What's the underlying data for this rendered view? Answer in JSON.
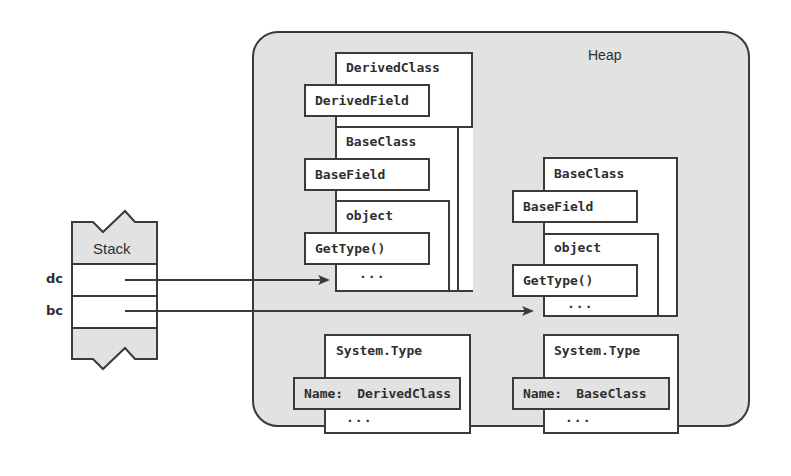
{
  "heap": {
    "label": "Heap"
  },
  "stack": {
    "label": "Stack",
    "slots": [
      {
        "name": "dc",
        "points_to": "derived_object"
      },
      {
        "name": "bc",
        "points_to": "base_object"
      }
    ]
  },
  "derived_object": {
    "class_title": "DerivedClass",
    "field": "DerivedField",
    "base": {
      "class_title": "BaseClass",
      "field": "BaseField",
      "object": {
        "title": "object",
        "method": "GetType()",
        "ellipsis": "..."
      }
    }
  },
  "base_object": {
    "class_title": "BaseClass",
    "field": "BaseField",
    "object": {
      "title": "object",
      "method": "GetType()",
      "ellipsis": "..."
    }
  },
  "type_objects": [
    {
      "title": "System.Type",
      "name_label": "Name:",
      "name_value": "DerivedClass",
      "ellipsis": "..."
    },
    {
      "title": "System.Type",
      "name_label": "Name:",
      "name_value": "BaseClass",
      "ellipsis": "..."
    }
  ],
  "colors": {
    "heap_fill": "#e2e2e2",
    "stroke": "#3a3a3a",
    "box_fill": "#ffffff",
    "text": "#2e2e2e"
  }
}
